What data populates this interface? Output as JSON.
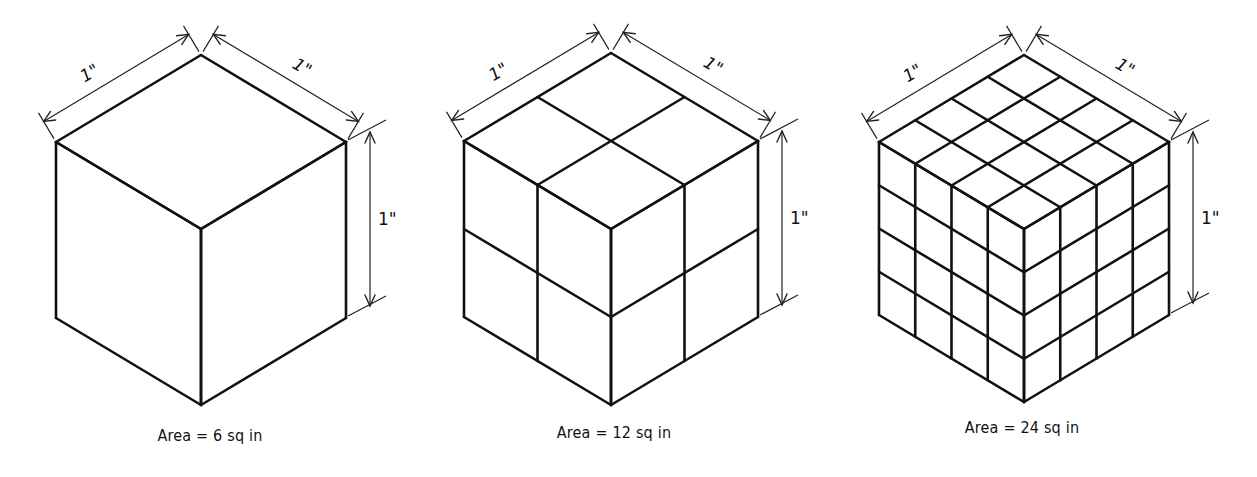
{
  "figure": {
    "edge_color": "#111111",
    "dimension_color": "#222222",
    "background": "#ffffff"
  },
  "cubes": [
    {
      "id": "cube-1",
      "subdivisions": 1,
      "origin": [
        201,
        55
      ],
      "half_width": 145,
      "rise": 87,
      "height": 176,
      "dimensions": {
        "top_left": "1\"",
        "top_right": "1\"",
        "vertical": "1\""
      },
      "caption": "Area = 6 sq in",
      "caption_pos": [
        210,
        438
      ]
    },
    {
      "id": "cube-2",
      "subdivisions": 2,
      "origin": [
        611,
        53
      ],
      "half_width": 147,
      "rise": 88,
      "height": 176,
      "dimensions": {
        "top_left": "1\"",
        "top_right": "1\"",
        "vertical": "1\""
      },
      "caption": "Area = 12 sq in",
      "caption_pos": [
        614,
        435
      ]
    },
    {
      "id": "cube-3",
      "subdivisions": 4,
      "origin": [
        1024,
        55
      ],
      "half_width": 145,
      "rise": 87,
      "height": 173,
      "dimensions": {
        "top_left": "1\"",
        "top_right": "1\"",
        "vertical": "1\""
      },
      "caption": "Area = 24 sq in",
      "caption_pos": [
        1022,
        430
      ]
    }
  ]
}
